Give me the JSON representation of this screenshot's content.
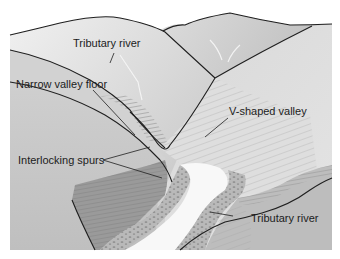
{
  "diagram": {
    "labels": {
      "tributary_river_top": "Tributary river",
      "narrow_valley_floor": "Narrow valley floor",
      "v_shaped_valley": "V-shaped valley",
      "interlocking_spurs": "Interlocking spurs",
      "tributary_river_bottom": "Tributary river"
    },
    "colors": {
      "background": "#ffffff",
      "hill_light": "#e6e6e6",
      "hill_mid": "#c9c9c9",
      "hill_dark": "#a6a6a6",
      "spur_dark": "#8f8f8f",
      "river": "#f7f7f7",
      "outline": "#1f1f1f"
    }
  }
}
